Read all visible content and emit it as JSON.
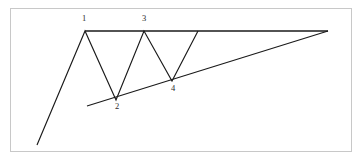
{
  "figure": {
    "background_color": "#ffffff",
    "frame_color": "#c8c8c8",
    "line_color": "#1a1a1a",
    "label_color": "#2b2b2b"
  },
  "chart_data": {
    "type": "line",
    "subtitle": "",
    "xlabel": "",
    "ylabel": "",
    "grid": false,
    "legend": false,
    "xlim": [
      0,
      362
    ],
    "ylim": [
      162,
      0
    ],
    "annotations": [
      {
        "label": "1",
        "x": 84,
        "y": 21,
        "point_x": 85,
        "point_y": 31,
        "role": "first-peak"
      },
      {
        "label": "2",
        "x": 117,
        "y": 109,
        "point_x": 116,
        "point_y": 100,
        "role": "first-trough"
      },
      {
        "label": "3",
        "x": 144,
        "y": 21,
        "point_x": 144,
        "point_y": 31,
        "role": "second-peak"
      },
      {
        "label": "4",
        "x": 173,
        "y": 91,
        "point_x": 172,
        "point_y": 81,
        "role": "second-trough"
      }
    ],
    "series": [
      {
        "name": "price-path",
        "role": "zigzag-price-action",
        "points": [
          [
            37,
            145
          ],
          [
            85,
            31
          ],
          [
            116,
            100
          ],
          [
            144,
            31
          ],
          [
            172,
            81
          ],
          [
            198,
            31
          ]
        ]
      },
      {
        "name": "resistance",
        "role": "horizontal-resistance-line",
        "points": [
          [
            85,
            31
          ],
          [
            328,
            31
          ]
        ]
      },
      {
        "name": "support",
        "role": "rising-support-trendline",
        "points": [
          [
            87,
            106
          ],
          [
            328,
            31
          ]
        ]
      }
    ]
  },
  "frame": {
    "x": 10,
    "y": 8,
    "width": 342,
    "height": 144
  }
}
